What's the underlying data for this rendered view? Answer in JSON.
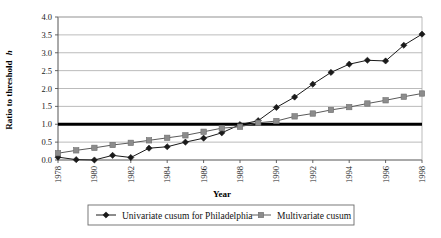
{
  "chart_data": {
    "type": "line",
    "title": "",
    "xlabel": "Year",
    "ylabel": "Ratio to threshold h",
    "ylabel_plain": "Ratio to threshold",
    "ylabel_italic_suffix": "h",
    "x": [
      1978,
      1979,
      1980,
      1981,
      1982,
      1983,
      1984,
      1985,
      1986,
      1987,
      1988,
      1989,
      1990,
      1991,
      1992,
      1993,
      1994,
      1995,
      1996,
      1997,
      1998
    ],
    "xlim": [
      1978,
      1998
    ],
    "ylim": [
      0.0,
      4.0
    ],
    "ytick_labels": [
      "0.0",
      "0.5",
      "1.0",
      "1.5",
      "2.0",
      "2.5",
      "3.0",
      "3.5",
      "4.0"
    ],
    "ytick_values": [
      0.0,
      0.5,
      1.0,
      1.5,
      2.0,
      2.5,
      3.0,
      3.5,
      4.0
    ],
    "xtick_labels": [
      "1978",
      "1980",
      "1982",
      "1984",
      "1986",
      "1988",
      "1990",
      "1992",
      "1994",
      "1996",
      "1998"
    ],
    "xtick_values": [
      1978,
      1980,
      1982,
      1984,
      1986,
      1988,
      1990,
      1992,
      1994,
      1996,
      1998
    ],
    "grid": true,
    "grid_color": "#a9a9a9",
    "legend_position": "below",
    "threshold": {
      "value": 1.0,
      "color": "#000000",
      "width": 3
    },
    "series": [
      {
        "name": "Univariate cusum for Philadelphia",
        "marker": "diamond",
        "color": "#1a1a1a",
        "line_color": "#1a1a1a",
        "values": [
          0.08,
          0.01,
          0.0,
          0.13,
          0.07,
          0.33,
          0.37,
          0.5,
          0.61,
          0.76,
          0.99,
          1.1,
          1.47,
          1.76,
          2.12,
          2.45,
          2.68,
          2.79,
          2.77,
          3.21,
          3.52
        ]
      },
      {
        "name": "Multivariate cusum",
        "marker": "square",
        "color": "#8c8c8c",
        "line_color": "#5a5a5a",
        "values": [
          0.19,
          0.27,
          0.34,
          0.42,
          0.48,
          0.55,
          0.62,
          0.69,
          0.79,
          0.89,
          0.93,
          1.04,
          1.09,
          1.22,
          1.3,
          1.4,
          1.48,
          1.58,
          1.67,
          1.77,
          1.86
        ]
      }
    ]
  },
  "legend": {
    "entries": [
      {
        "label": "Univariate cusum for Philadelphia",
        "marker": "diamond",
        "color": "#1a1a1a"
      },
      {
        "label": "Multivariate cusum",
        "marker": "square",
        "color": "#8c8c8c"
      }
    ]
  }
}
